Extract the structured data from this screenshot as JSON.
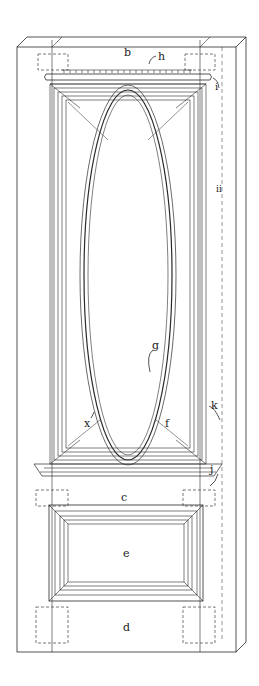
{
  "figure": {
    "colors": {
      "ink": "#2a2a2a",
      "hidden": "#555555",
      "background": "#ffffff"
    }
  },
  "labels": {
    "b": "b",
    "h": "h",
    "i": "i",
    "ii": "ii",
    "g": "g",
    "k": "k",
    "x": "x",
    "f": "f",
    "j": "j",
    "c": "c",
    "e": "e",
    "d": "d"
  }
}
